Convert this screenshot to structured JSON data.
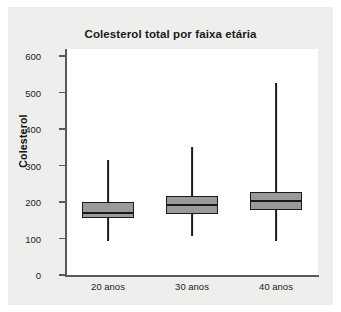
{
  "chart_data": {
    "type": "box",
    "title": "Colesterol total por faixa etária",
    "xlabel": "",
    "ylabel": "Colesterol",
    "ylim": [
      0,
      620
    ],
    "yticks": [
      0,
      100,
      200,
      300,
      400,
      500,
      600
    ],
    "ytick_labels": [
      "0",
      "100",
      "200",
      "300",
      "400",
      "500",
      "600"
    ],
    "categories": [
      "20 anos",
      "30 anos",
      "40 anos"
    ],
    "grid": false,
    "legend": null,
    "boxes": [
      {
        "category": "20 anos",
        "whisker_low": 93,
        "q1": 155,
        "median": 171,
        "q3": 200,
        "whisker_high": 315
      },
      {
        "category": "30 anos",
        "whisker_low": 106,
        "q1": 168,
        "median": 191,
        "q3": 217,
        "whisker_high": 351
      },
      {
        "category": "40 anos",
        "whisker_low": 92,
        "q1": 178,
        "median": 203,
        "q3": 227,
        "whisker_high": 525
      }
    ],
    "colors": {
      "box_fill": "#9a9a9a",
      "box_edge": "#1a1a1a",
      "plot_background": "#ffffff",
      "figure_background": "#eeeeec",
      "axis": "#595959"
    }
  }
}
